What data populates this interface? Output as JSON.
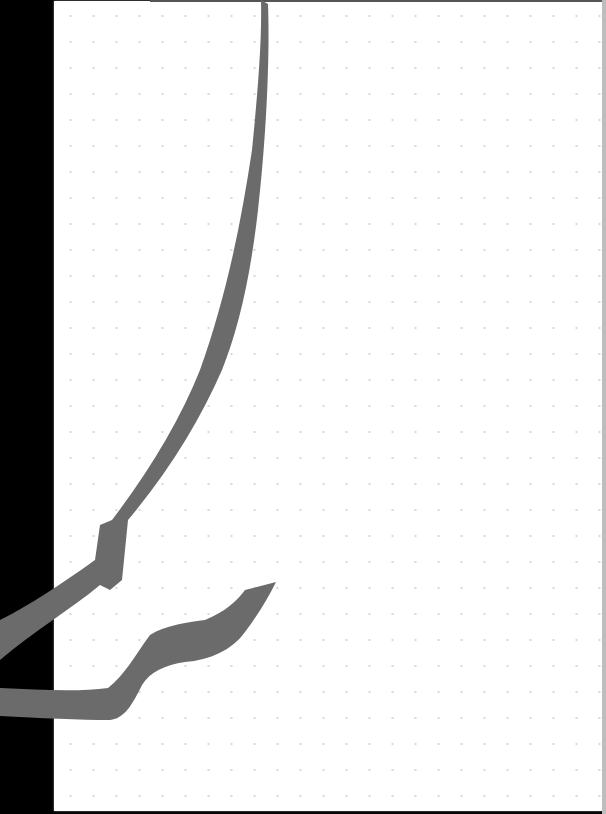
{
  "canvas": {
    "background": "#ffffff",
    "grid": "dot",
    "grid_dot_color": "#d6d6d6",
    "grid_spacing_x": 23,
    "grid_spacing_y": 26,
    "side_panel_color": "#000000"
  },
  "strokes": [
    {
      "name": "long-curve-stroke",
      "color": "#6b6b6b"
    },
    {
      "name": "wave-stroke",
      "color": "#6b6b6b"
    }
  ]
}
